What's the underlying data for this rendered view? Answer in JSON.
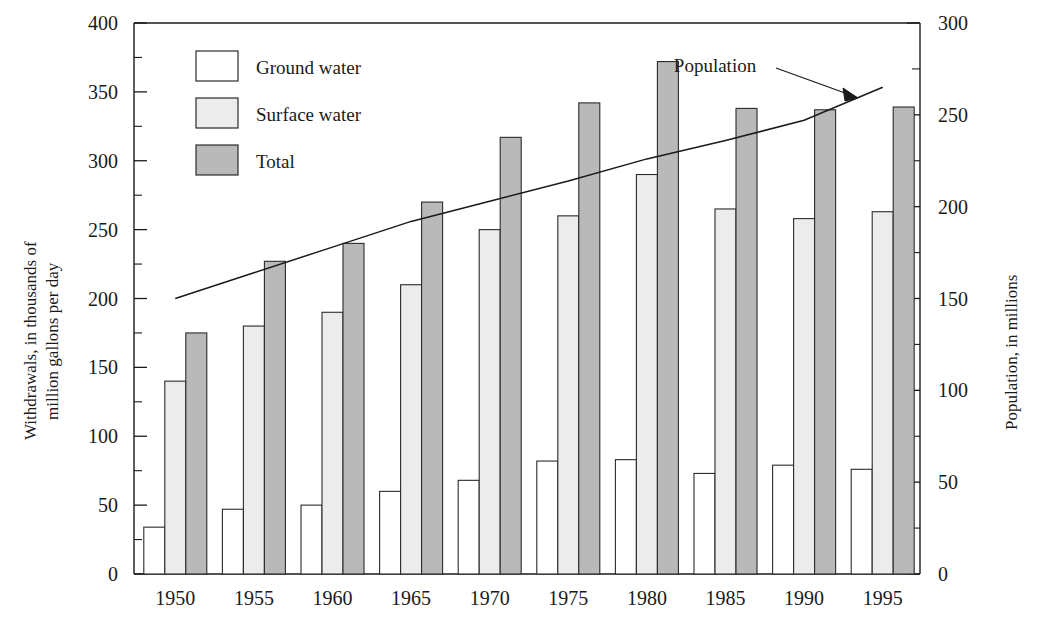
{
  "chart_data": {
    "type": "bar",
    "title": "",
    "subtitle": "",
    "categories": [
      "1950",
      "1955",
      "1960",
      "1965",
      "1970",
      "1975",
      "1980",
      "1985",
      "1990",
      "1995"
    ],
    "series": [
      {
        "name": "Ground water",
        "values": [
          34,
          47,
          50,
          60,
          68,
          82,
          83,
          73,
          79,
          76
        ],
        "color": "#ffffff"
      },
      {
        "name": "Surface water",
        "values": [
          140,
          180,
          190,
          210,
          250,
          260,
          290,
          265,
          258,
          263
        ],
        "color": "#ececec"
      },
      {
        "name": "Total",
        "values": [
          175,
          227,
          240,
          270,
          317,
          342,
          372,
          338,
          337,
          339
        ],
        "color": "#b9b9b9"
      }
    ],
    "overlay_series": [
      {
        "name": "Population",
        "type": "line",
        "axis": "right",
        "x": [
          "1950",
          "1955",
          "1960",
          "1965",
          "1970",
          "1975",
          "1980",
          "1985",
          "1990",
          "1995"
        ],
        "values": [
          150,
          164,
          178,
          192,
          203,
          214,
          226,
          236,
          247,
          265
        ],
        "color": "#1a1a1a"
      }
    ],
    "xlabel": "",
    "ylabel": "Withdrawals, in thousands of million gallons per day",
    "y2label": "Population, in millions",
    "ylim": [
      0,
      400
    ],
    "y2lim": [
      0,
      300
    ],
    "yticks": [
      "0",
      "50",
      "100",
      "150",
      "200",
      "250",
      "300",
      "350",
      "400"
    ],
    "y2ticks": [
      "0",
      "50",
      "100",
      "150",
      "200",
      "250",
      "300"
    ],
    "grid": false,
    "legend_position": "upper-left",
    "annotations": [
      {
        "text": "Population",
        "points_to": "population-line"
      }
    ]
  },
  "legend": {
    "items": [
      {
        "label": "Ground water",
        "swatch": "white-swatch"
      },
      {
        "label": "Surface water",
        "swatch": "light-gray-swatch"
      },
      {
        "label": "Total",
        "swatch": "medium-gray-swatch"
      }
    ]
  },
  "axes": {
    "left_title_line1": "Withdrawals, in thousands of",
    "left_title_line2": "million gallons per day",
    "right_title": "Population, in millions"
  },
  "annotation": {
    "population_label": "Population"
  },
  "colors": {
    "ground_water": "#ffffff",
    "surface_water": "#ececec",
    "total": "#b9b9b9",
    "ink": "#1a1a1a"
  }
}
